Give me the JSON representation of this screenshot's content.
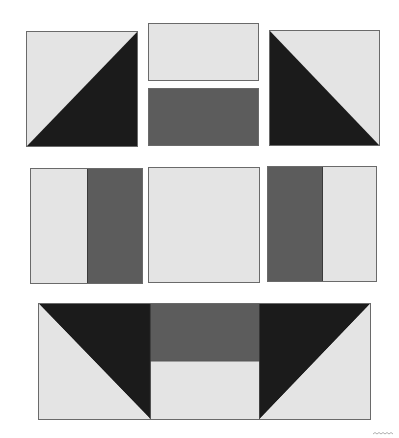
{
  "diagram": {
    "title": "",
    "colors": {
      "light": "#e4e4e4",
      "medium": "#5c5c5c",
      "dark": "#1b1b1b",
      "border": "#6a6a6a",
      "background": "#ffffff"
    },
    "rows": [
      {
        "name": "top-row",
        "pieces": [
          {
            "id": "half-square-triangle-left",
            "shape": "square split on diagonal",
            "fills": [
              "light (upper-left)",
              "dark (lower-right)"
            ]
          },
          {
            "id": "stacked-rectangles",
            "shape": "two stacked rectangles",
            "fills": [
              "light (top)",
              "medium (bottom)"
            ]
          },
          {
            "id": "half-square-triangle-right",
            "shape": "square split on diagonal",
            "fills": [
              "dark (lower-left)",
              "light (upper-right)"
            ]
          }
        ]
      },
      {
        "name": "middle-row",
        "pieces": [
          {
            "id": "two-strip-square-left",
            "shape": "square split vertically",
            "fills": [
              "light (left)",
              "medium (right)"
            ]
          },
          {
            "id": "plain-square",
            "shape": "plain square",
            "fills": [
              "light"
            ]
          },
          {
            "id": "two-strip-square-right",
            "shape": "square split vertically",
            "fills": [
              "medium (left)",
              "light (right)"
            ]
          }
        ]
      },
      {
        "name": "bottom-row",
        "pieces": [
          {
            "id": "assembled-flying-unit",
            "shape": "rectangle: triangle + two-band center + triangle",
            "fills": [
              "dark triangle / light triangle",
              "medium (top) / light (bottom)",
              "dark triangle / light triangle"
            ]
          }
        ]
      }
    ],
    "corner_mark": "decorative-scallop"
  }
}
